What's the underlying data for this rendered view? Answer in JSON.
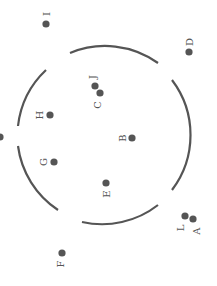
{
  "figure": {
    "width": 217,
    "height": 286,
    "background": "#ffffff",
    "ink_color": "#555555",
    "label_rotation_deg": -90,
    "circle": {
      "cx": 106,
      "cy": 136,
      "r": 91,
      "segments": [
        {
          "name": "top",
          "from": [
            70,
            53
          ],
          "to": [
            158,
            63
          ]
        },
        {
          "name": "right",
          "from": [
            172,
            80
          ],
          "to": [
            172,
            190
          ]
        },
        {
          "name": "bottom",
          "from": [
            158,
            205
          ],
          "to": [
            82,
            222
          ]
        },
        {
          "name": "lower-left",
          "from": [
            58,
            210
          ],
          "to": [
            18,
            146
          ]
        },
        {
          "name": "upper-left",
          "from": [
            18,
            126
          ],
          "to": [
            46,
            70
          ]
        }
      ]
    },
    "points": [
      {
        "id": "A",
        "x": 193,
        "y": 219,
        "lx": 196,
        "ly": 231
      },
      {
        "id": "B",
        "x": 132,
        "y": 138,
        "lx": 122,
        "ly": 138
      },
      {
        "id": "C",
        "x": 100,
        "y": 93,
        "lx": 97,
        "ly": 105
      },
      {
        "id": "D",
        "x": 189,
        "y": 52,
        "lx": 189,
        "ly": 42
      },
      {
        "id": "E",
        "x": 106,
        "y": 183,
        "lx": 106,
        "ly": 194
      },
      {
        "id": "F",
        "x": 62,
        "y": 253,
        "lx": 60,
        "ly": 264
      },
      {
        "id": "G",
        "x": 54,
        "y": 162,
        "lx": 43,
        "ly": 162
      },
      {
        "id": "H",
        "x": 50,
        "y": 115,
        "lx": 39,
        "ly": 115
      },
      {
        "id": "I",
        "x": 46,
        "y": 24,
        "lx": 46,
        "ly": 14
      },
      {
        "id": "J",
        "x": 95,
        "y": 86,
        "lx": 92,
        "ly": 77
      },
      {
        "id": "L",
        "x": 185,
        "y": 216,
        "lx": 180,
        "ly": 228
      },
      {
        "id": "",
        "x": 0,
        "y": 137,
        "lx": null,
        "ly": null
      }
    ]
  }
}
